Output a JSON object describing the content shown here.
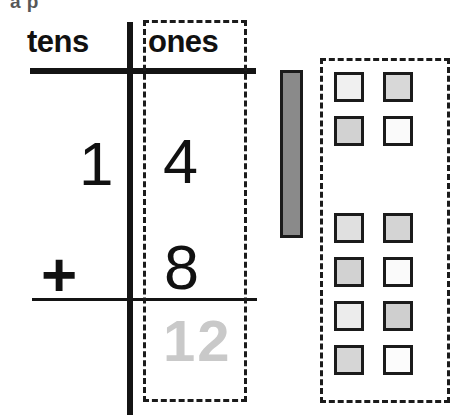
{
  "worksheet": {
    "top_cut_text": "a p",
    "headers": {
      "tens": "tens",
      "ones": "ones"
    },
    "problem": {
      "addend1_tens": "1",
      "addend1_ones": "4",
      "operator": "+",
      "addend2_ones": "8",
      "answer_ones": "12"
    },
    "colors": {
      "ink": "#141414",
      "answer_gray": "#c9c9c9",
      "rod_fill": "#8a8a8a",
      "paper": "#ffffff"
    },
    "blocks": {
      "rod_count": 1,
      "rod_label": "ten-rod",
      "group_top": {
        "label": "four-ones-group",
        "count": 4,
        "squares": [
          {
            "x": 334,
            "y": 72,
            "fill": "#f0f0f0"
          },
          {
            "x": 383,
            "y": 72,
            "fill": "#d8d8d8"
          },
          {
            "x": 334,
            "y": 116,
            "fill": "#d2d2d2"
          },
          {
            "x": 383,
            "y": 116,
            "fill": "#fafafa"
          }
        ]
      },
      "group_bottom": {
        "label": "eight-ones-group",
        "count": 8,
        "squares": [
          {
            "x": 334,
            "y": 213,
            "fill": "#e0e0e0"
          },
          {
            "x": 383,
            "y": 213,
            "fill": "#d4d4d4"
          },
          {
            "x": 334,
            "y": 257,
            "fill": "#d2d2d2"
          },
          {
            "x": 383,
            "y": 257,
            "fill": "#fafafa"
          },
          {
            "x": 334,
            "y": 301,
            "fill": "#ececec"
          },
          {
            "x": 383,
            "y": 301,
            "fill": "#cfcfcf"
          },
          {
            "x": 334,
            "y": 345,
            "fill": "#d6d6d6"
          },
          {
            "x": 383,
            "y": 345,
            "fill": "#fcfcfc"
          }
        ]
      }
    }
  }
}
